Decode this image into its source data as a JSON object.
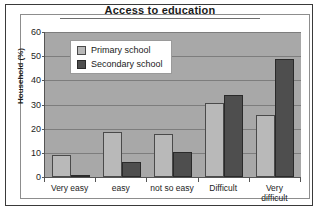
{
  "chart_data": {
    "type": "bar",
    "title": "Access to education",
    "xlabel": "",
    "ylabel": "Household (%)",
    "ylim": [
      0,
      60
    ],
    "yticks": [
      0,
      10,
      20,
      30,
      40,
      50,
      60
    ],
    "grid": true,
    "legend_position": "top-left inside plot",
    "categories": [
      "Very easy",
      "easy",
      "not so easy",
      "Difficult",
      "Very difficult"
    ],
    "category_lines": [
      [
        "Very easy"
      ],
      [
        "easy"
      ],
      [
        "not so easy"
      ],
      [
        "Difficult"
      ],
      [
        "Very",
        "difficult"
      ]
    ],
    "series": [
      {
        "name": "Primary school",
        "color": "#b9b9b9",
        "values": [
          9,
          18.5,
          18,
          30.5,
          25.5
        ]
      },
      {
        "name": "Secondary school",
        "color": "#4e4e4e",
        "values": [
          1,
          6.3,
          10.5,
          34,
          49
        ]
      }
    ]
  }
}
